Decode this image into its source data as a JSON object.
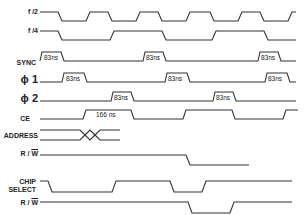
{
  "diagram": {
    "type": "timing-diagram",
    "signals": [
      {
        "id": "f2",
        "label": "f /2",
        "y": 12
      },
      {
        "id": "f4",
        "label": "f /4",
        "y": 31
      },
      {
        "id": "sync",
        "label": "SYNC",
        "y": 52
      },
      {
        "id": "phi1",
        "label": "ϕ 1",
        "y": 75
      },
      {
        "id": "phi2",
        "label": "ϕ 2",
        "y": 94
      },
      {
        "id": "ce",
        "label": "CE",
        "y": 111
      },
      {
        "id": "address",
        "label": "ADDRESS",
        "y": 129
      },
      {
        "id": "rw1",
        "label_r": "R /",
        "label_w": "W",
        "y": 151
      },
      {
        "id": "chip_select",
        "label_line1": "CHIP",
        "label_line2": "SELECT",
        "y": 178
      },
      {
        "id": "rw2",
        "label_r": "R /",
        "label_w": "W",
        "y": 200
      }
    ],
    "annotations": {
      "pulse_83ns": "83ns",
      "ce_166ns": "166 ns"
    },
    "line_color": "#333333"
  }
}
